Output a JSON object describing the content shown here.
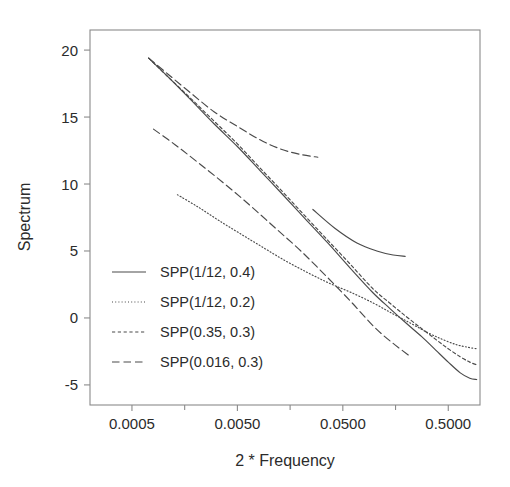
{
  "chart_data": {
    "type": "line",
    "title": "",
    "xlabel": "2 * Frequency",
    "ylabel": "Spectrum",
    "x_scale": "log10",
    "xlim": [
      0.0002,
      1.0
    ],
    "ylim": [
      -6.5,
      21.5
    ],
    "grid": false,
    "legend_position": "lower-left-inside",
    "xticks": [
      0.0005,
      0.005,
      0.05,
      0.5
    ],
    "xticklabels": [
      "0.0005",
      "0.0050",
      "0.0500",
      "0.5000"
    ],
    "yticks": [
      -5,
      0,
      5,
      10,
      15,
      20
    ],
    "yticklabels": [
      "-5",
      "0",
      "5",
      "10",
      "15",
      "20"
    ],
    "series": [
      {
        "name": "SPP(1/12, 0.4)",
        "dash": "solid",
        "color": "#4a4a4a",
        "x": [
          0.00072,
          0.0011,
          0.0018,
          0.003,
          0.005,
          0.0082,
          0.0135,
          0.022,
          0.036,
          0.059,
          0.096,
          0.14,
          0.2,
          0.28,
          0.38,
          0.5,
          0.65,
          0.8,
          0.93
        ],
        "y": [
          19.4,
          18.0,
          16.3,
          14.5,
          12.8,
          11.0,
          9.2,
          7.4,
          5.6,
          3.7,
          1.9,
          0.7,
          -0.4,
          -1.4,
          -2.4,
          -3.3,
          -4.1,
          -4.5,
          -4.6
        ]
      },
      {
        "name": "SPP(1/12, 0.2)",
        "dash": "dotted",
        "color": "#6e6e6e",
        "x": [
          0.00135,
          0.0021,
          0.0033,
          0.0053,
          0.0086,
          0.014,
          0.023,
          0.037,
          0.06,
          0.098,
          0.15,
          0.22,
          0.32,
          0.44,
          0.6,
          0.78,
          0.93
        ],
        "y": [
          9.2,
          8.3,
          7.3,
          6.3,
          5.3,
          4.3,
          3.4,
          2.6,
          1.9,
          1.1,
          0.3,
          -0.4,
          -1.1,
          -1.6,
          -2.0,
          -2.2,
          -2.3
        ]
      },
      {
        "name": "SPP(0.35, 0.3)",
        "dash": "short-dash",
        "color": "#5a5a5a",
        "x": [
          0.00072,
          0.0011,
          0.0018,
          0.003,
          0.005,
          0.0082,
          0.0135,
          0.022,
          0.036,
          0.059,
          0.096,
          0.14,
          0.2,
          0.28,
          0.38,
          0.5,
          0.65,
          0.8,
          0.93
        ],
        "y": [
          19.4,
          18.0,
          16.4,
          14.7,
          13.0,
          11.2,
          9.4,
          7.6,
          5.8,
          4.0,
          2.2,
          1.1,
          0.1,
          -0.8,
          -1.6,
          -2.3,
          -2.9,
          -3.3,
          -3.5
        ]
      },
      {
        "name": "SPP(0.016, 0.3)",
        "dash": "long-dash",
        "color": "#6a6a6a",
        "x": [
          0.00072,
          0.0011,
          0.0018,
          0.003,
          0.005,
          0.0082,
          0.013,
          0.02,
          0.029
        ],
        "y": [
          19.4,
          18.2,
          16.8,
          15.4,
          14.3,
          13.3,
          12.6,
          12.2,
          12.0
        ]
      },
      {
        "name": "SPP(0.016, 0.3) lower branch",
        "dash": "long-dash",
        "color": "#6a6a6a",
        "x": [
          0.0008,
          0.0013,
          0.0022,
          0.0038,
          0.0066,
          0.0115,
          0.02,
          0.035,
          0.06,
          0.1,
          0.15,
          0.22
        ],
        "y": [
          14.1,
          12.9,
          11.5,
          10.0,
          8.4,
          6.7,
          5.0,
          3.1,
          1.2,
          -0.7,
          -1.9,
          -2.9
        ]
      },
      {
        "name": "SPP(1/12, 0.4) flat branch",
        "dash": "solid",
        "color": "#4a4a4a",
        "x": [
          0.026,
          0.042,
          0.068,
          0.105,
          0.15,
          0.195
        ],
        "y": [
          8.1,
          6.7,
          5.6,
          5.0,
          4.7,
          4.6
        ]
      }
    ],
    "legend_entries": [
      {
        "label": "SPP(1/12, 0.4)",
        "dash": "solid"
      },
      {
        "label": "SPP(1/12, 0.2)",
        "dash": "dotted"
      },
      {
        "label": "SPP(0.35, 0.3)",
        "dash": "short-dash"
      },
      {
        "label": "SPP(0.016, 0.3)",
        "dash": "long-dash"
      }
    ]
  },
  "colors": {
    "background": "#ffffff",
    "axis": "#8a8a8a",
    "text": "#2b2b2b",
    "line": "#4a4a4a"
  }
}
